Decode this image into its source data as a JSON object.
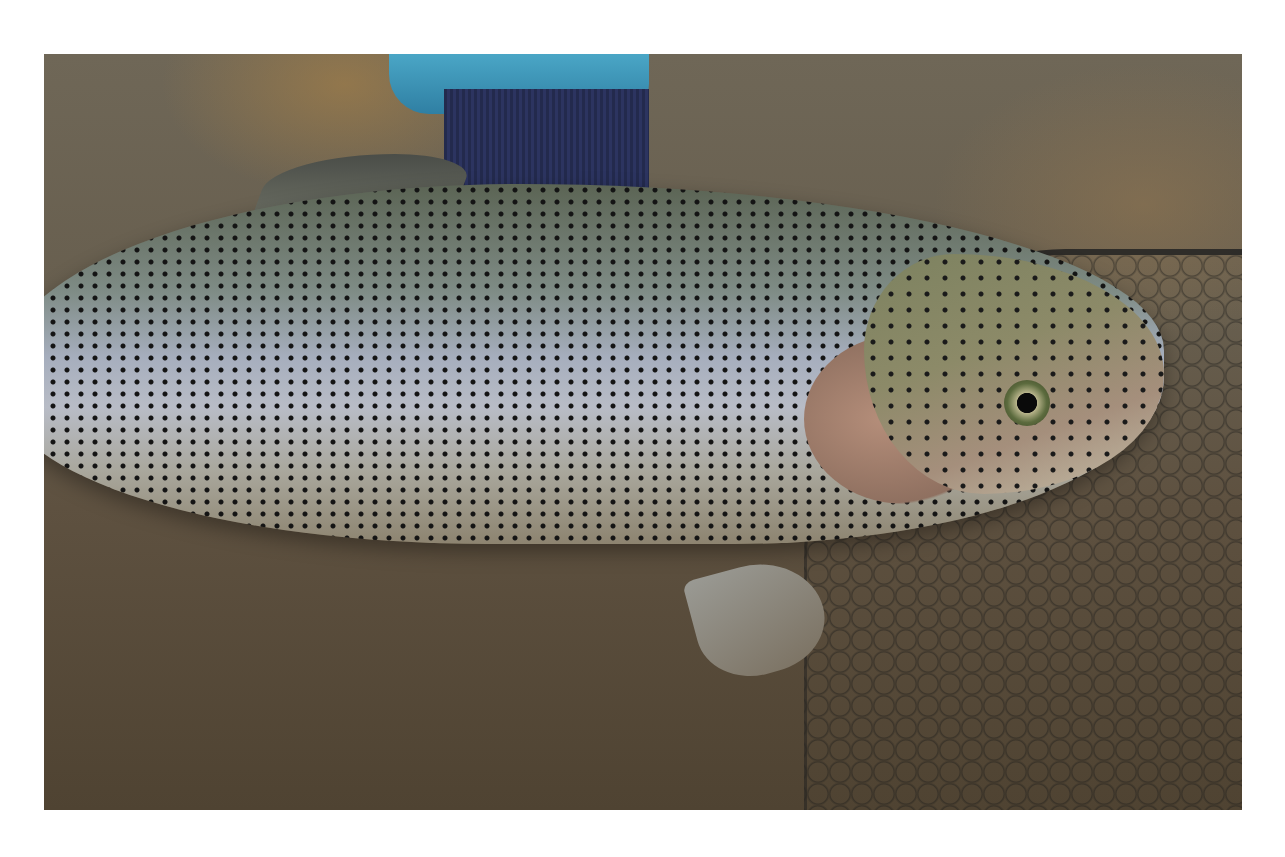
{
  "image": {
    "description": "Rainbow trout held in shallow muddy water beside a landing net",
    "subjects": [
      "rainbow trout",
      "hand with blue sleeve and navy cuff",
      "landing net",
      "shallow water"
    ],
    "colors": {
      "border": "#ffffff",
      "water": "#665c4c",
      "fish_back": "#5b6454",
      "fish_belly": "#b8bcc6",
      "sleeve": "#3c97bc",
      "cuff": "#262d55",
      "net": "#1e1f20"
    }
  }
}
